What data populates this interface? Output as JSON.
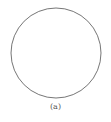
{
  "figure": {
    "shape": "circle",
    "center": [
      56,
      53
    ],
    "radius": 45,
    "stroke_color": "#666666",
    "fill_color": "#ffffff"
  },
  "caption": "(a)"
}
